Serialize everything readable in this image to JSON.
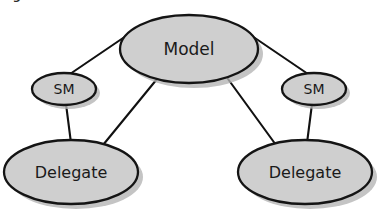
{
  "figure": {
    "caption_fragment": "Figure 10-4.  Model",
    "background_color": "#ffffff"
  },
  "style": {
    "node_fill": "#cfcfcf",
    "node_stroke": "#141414",
    "edge_stroke": "#111111",
    "shadow_color": "#b3b3b3",
    "label_color": "#1a1a1a"
  },
  "diagram": {
    "type": "node-link-graph",
    "nodes": [
      {
        "id": "model",
        "label": "Model",
        "shape": "ellipse",
        "cx": 189,
        "cy": 49,
        "rx": 69,
        "ry": 34
      },
      {
        "id": "sm-left",
        "label": "SM",
        "shape": "ellipse",
        "cx": 64,
        "cy": 89,
        "rx": 32,
        "ry": 16
      },
      {
        "id": "sm-right",
        "label": "SM",
        "shape": "ellipse",
        "cx": 314,
        "cy": 89,
        "rx": 32,
        "ry": 16
      },
      {
        "id": "delegate-left",
        "label": "Delegate",
        "shape": "ellipse",
        "cx": 71,
        "cy": 172,
        "rx": 67,
        "ry": 32
      },
      {
        "id": "delegate-right",
        "label": "Delegate",
        "shape": "ellipse",
        "cx": 305,
        "cy": 172,
        "rx": 67,
        "ry": 32
      }
    ],
    "edges": [
      {
        "id": "edge-model-sm-left",
        "from": "model",
        "to": "sm-left",
        "x1": 126,
        "y1": 36,
        "x2": 70,
        "y2": 74
      },
      {
        "id": "edge-model-sm-right",
        "from": "model",
        "to": "sm-right",
        "x1": 252,
        "y1": 36,
        "x2": 308,
        "y2": 74
      },
      {
        "id": "edge-sm-left-delegate-left",
        "from": "sm-left",
        "to": "delegate-left",
        "x1": 66,
        "y1": 104,
        "x2": 71,
        "y2": 143
      },
      {
        "id": "edge-sm-right-delegate-right",
        "from": "sm-right",
        "to": "delegate-right",
        "x1": 312,
        "y1": 104,
        "x2": 307,
        "y2": 143
      },
      {
        "id": "edge-model-delegate-left",
        "from": "model",
        "to": "delegate-left",
        "x1": 157,
        "y1": 79,
        "x2": 103,
        "y2": 145
      },
      {
        "id": "edge-model-delegate-right",
        "from": "model",
        "to": "delegate-right",
        "x1": 228,
        "y1": 79,
        "x2": 276,
        "y2": 145
      }
    ]
  }
}
